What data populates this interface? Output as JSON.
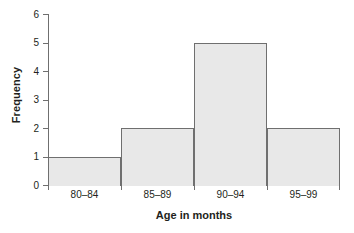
{
  "chart_data": {
    "type": "bar",
    "title": "",
    "subtitle": "",
    "xlabel": "Age in months",
    "ylabel": "Frequency",
    "categories": [
      "80–84",
      "85–89",
      "90–94",
      "95–99"
    ],
    "values": [
      1,
      2,
      5,
      2
    ],
    "series": [
      {
        "name": "Frequency",
        "values": [
          1,
          2,
          5,
          2
        ]
      }
    ],
    "ylim": [
      0,
      6
    ],
    "yticks": [
      0,
      1,
      2,
      3,
      4,
      5,
      6
    ],
    "ytick_labels": [
      "0",
      "1",
      "2",
      "3",
      "4",
      "5",
      "6"
    ],
    "grid": false,
    "legend": false,
    "legend_position": "none",
    "bar_gap": 0,
    "annotations": [],
    "colors": {
      "bar_fill": "#e8e8e8",
      "bar_edge": "#6f6f6f",
      "axis": "#6f6f6f",
      "text": "#231f20",
      "background": "#ffffff"
    }
  }
}
